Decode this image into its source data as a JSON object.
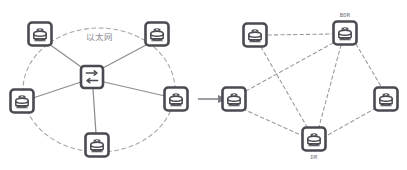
{
  "diagram": {
    "title_ghost": "",
    "colors": {
      "icon": "#4a4a52",
      "icon_dark": "#3c3c44",
      "link_solid": "#8c8c94",
      "link_dashed": "#9a9aa2",
      "ellipse": "#a6a6ae",
      "label": "#6e6e75",
      "cloud_label": "#8b8b92",
      "background": "#ffffff"
    },
    "left_cluster": {
      "name": "ethernet-broadcast-network",
      "cloud_label": "以太网",
      "boundary_shape": "dashed-ellipse",
      "center_device": {
        "id": "switch",
        "icon": "switch-icon",
        "glyph": "bidirectional-arrows",
        "label": "",
        "x": 92,
        "y": 77
      },
      "nodes": [
        {
          "id": "l-top-left",
          "icon": "router-icon",
          "label": "",
          "x": 40,
          "y": 34
        },
        {
          "id": "l-top-right",
          "icon": "router-icon",
          "label": "",
          "x": 157,
          "y": 34
        },
        {
          "id": "l-mid-left",
          "icon": "router-icon",
          "label": "",
          "x": 22,
          "y": 101
        },
        {
          "id": "l-mid-right",
          "icon": "router-icon",
          "label": "",
          "x": 176,
          "y": 99
        },
        {
          "id": "l-bottom",
          "icon": "router-icon",
          "label": "",
          "x": 97,
          "y": 145
        }
      ],
      "links": [
        {
          "from": "l-top-left",
          "to": "switch",
          "style": "solid"
        },
        {
          "from": "l-top-right",
          "to": "switch",
          "style": "solid"
        },
        {
          "from": "l-mid-left",
          "to": "switch",
          "style": "solid"
        },
        {
          "from": "l-mid-right",
          "to": "switch",
          "style": "solid"
        },
        {
          "from": "l-bottom",
          "to": "switch",
          "style": "solid"
        }
      ]
    },
    "transition_arrow": {
      "name": "transition-arrow",
      "style": "solid-arrow",
      "direction": "right",
      "x1": 198,
      "x2": 228,
      "y": 99
    },
    "right_cluster": {
      "name": "ospf-adjacency-network",
      "nodes": [
        {
          "id": "r-top-left",
          "icon": "router-icon",
          "label": "",
          "x": 255,
          "y": 35
        },
        {
          "id": "r-bdr",
          "icon": "router-icon",
          "label": "BDR",
          "x": 345,
          "y": 33
        },
        {
          "id": "r-mid-left",
          "icon": "router-icon",
          "label": "",
          "x": 234,
          "y": 99
        },
        {
          "id": "r-mid-right",
          "icon": "router-icon",
          "label": "",
          "x": 386,
          "y": 99
        },
        {
          "id": "r-dr",
          "icon": "router-icon",
          "label": "DR",
          "x": 314,
          "y": 139
        }
      ],
      "links": [
        {
          "from": "r-top-left",
          "to": "r-bdr",
          "style": "dashed"
        },
        {
          "from": "r-top-left",
          "to": "r-dr",
          "style": "dashed"
        },
        {
          "from": "r-bdr",
          "to": "r-mid-left",
          "style": "dashed"
        },
        {
          "from": "r-bdr",
          "to": "r-dr",
          "style": "dashed"
        },
        {
          "from": "r-bdr",
          "to": "r-mid-right",
          "style": "dashed"
        },
        {
          "from": "r-mid-left",
          "to": "r-dr",
          "style": "dashed"
        },
        {
          "from": "r-mid-right",
          "to": "r-dr",
          "style": "dashed"
        }
      ]
    }
  }
}
